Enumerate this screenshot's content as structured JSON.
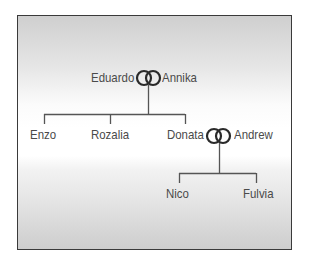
{
  "diagram": {
    "type": "family-tree",
    "couples": [
      {
        "partner_a": "Eduardo",
        "partner_b": "Annika",
        "symbol": "wedding-rings-icon"
      },
      {
        "partner_a": "Donata",
        "partner_b": "Andrew",
        "symbol": "wedding-rings-icon"
      }
    ],
    "generation_2": [
      "Enzo",
      "Rozalia",
      "Donata"
    ],
    "generation_3": [
      "Nico",
      "Fulvia"
    ],
    "labels": {
      "eduardo": "Eduardo",
      "annika": "Annika",
      "enzo": "Enzo",
      "rozalia": "Rozalia",
      "donata": "Donata",
      "andrew": "Andrew",
      "nico": "Nico",
      "fulvia": "Fulvia"
    },
    "colors": {
      "line": "#555555",
      "text": "#4a4a4a",
      "frame": "#3a3a3a"
    }
  }
}
